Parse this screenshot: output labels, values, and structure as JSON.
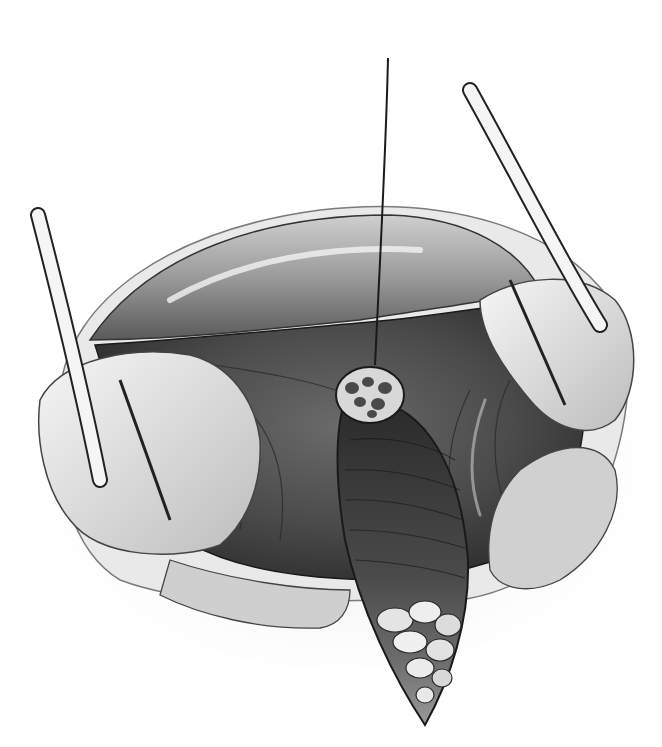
{
  "image": {
    "kind": "grayscale surgical illustration",
    "width": 662,
    "height": 747,
    "background": "#ffffff"
  },
  "elements": {
    "suture_thread": "vertical traction suture holding lesion",
    "lesion": "round nodular lesion with mottled surface",
    "incision": "elliptical incision opened below lesion",
    "fat_lobules": "yellowish fat lobules at base of incision (rendered grayscale)",
    "retractors": [
      "left retractor",
      "upper-right retractor"
    ],
    "retracted_tissue": [
      "left tissue flap",
      "right tissue flap",
      "upper tissue fold",
      "lower tissue fold"
    ]
  },
  "colors": {
    "ink": "#1a1a1a",
    "dark_cavity": "#3a3a3a",
    "mid_tissue": "#8a8a8a",
    "light_tissue": "#d9d9d9",
    "highlight": "#f4f4f4",
    "shadow_wash": "#e8e8e8"
  }
}
